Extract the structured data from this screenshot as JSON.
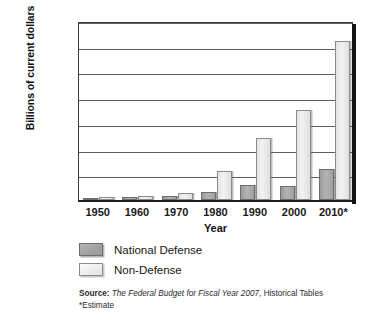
{
  "chart_data": {
    "type": "bar",
    "title": "",
    "xlabel": "Year",
    "ylabel": "Billions of current dollars",
    "categories": [
      "1950",
      "1960",
      "1970",
      "1980",
      "1990",
      "2000",
      "2010*"
    ],
    "series": [
      {
        "name": "National Defense",
        "color": "#a8a8a8",
        "values": [
          30,
          50,
          85,
          150,
          290,
          280,
          600
        ]
      },
      {
        "name": "Non-Defense",
        "color": "#ededed",
        "values": [
          55,
          85,
          130,
          560,
          1200,
          1750,
          3100
        ]
      }
    ],
    "ylim": [
      0,
      3500
    ],
    "ytick_values": [
      0,
      500,
      1000,
      1500,
      2000,
      2500,
      3000,
      3500
    ],
    "ytick_labels": [
      "0",
      "500",
      "1,000",
      "1,500",
      "2,000",
      "2,500",
      "3,000",
      "3,500"
    ],
    "grid": true,
    "legend_position": "below-plot"
  },
  "legend": {
    "items": [
      {
        "label": "National Defense",
        "swatch": "defense"
      },
      {
        "label": "Non-Defense",
        "swatch": "nondefense"
      }
    ]
  },
  "notes": {
    "source_label": "Source:",
    "source_title": "The Federal Budget for Fiscal Year 2007",
    "source_suffix": ", Historical Tables",
    "estimate": "*Estimate"
  }
}
